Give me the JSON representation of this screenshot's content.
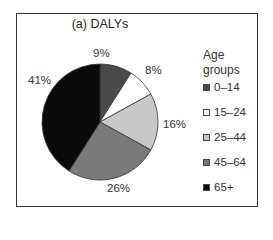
{
  "chart_data": {
    "type": "pie",
    "title": "(a) DALYs",
    "legend_title": "Age groups",
    "legend_position": "right",
    "categories": [
      "0–14",
      "15–24",
      "25–44",
      "45–64",
      "65+"
    ],
    "values": [
      9,
      8,
      16,
      26,
      41
    ],
    "value_labels": [
      "9%",
      "8%",
      "16%",
      "26%",
      "41%"
    ],
    "colors": [
      "#4a4a4a",
      "#ffffff",
      "#c8c8c8",
      "#7a7a7a",
      "#0a0a0a"
    ],
    "unit": "%"
  },
  "chart": {
    "title": "(a) DALYs",
    "legend": {
      "title_line1": "Age",
      "title_line2": "groups",
      "items": [
        {
          "label": "0–14",
          "color": "#4a4a4a"
        },
        {
          "label": "15–24",
          "color": "#ffffff"
        },
        {
          "label": "25–44",
          "color": "#c8c8c8"
        },
        {
          "label": "45–64",
          "color": "#7a7a7a"
        },
        {
          "label": "65+",
          "color": "#0a0a0a"
        }
      ]
    },
    "slice_labels": [
      "9%",
      "8%",
      "16%",
      "26%",
      "41%"
    ]
  }
}
